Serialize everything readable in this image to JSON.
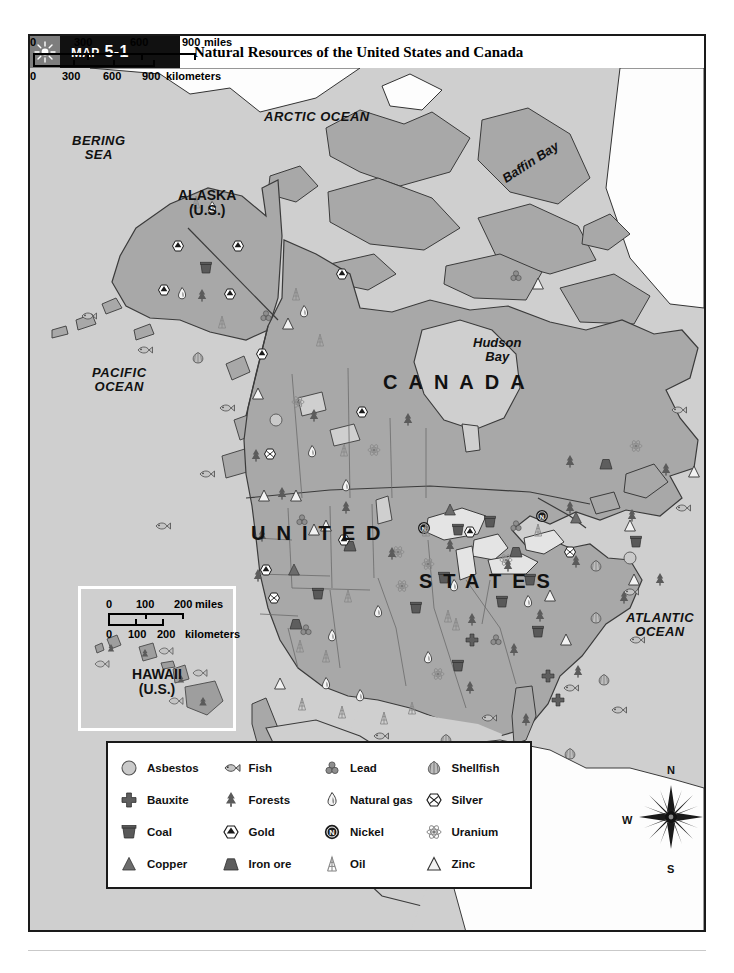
{
  "header": {
    "sun_icon": "sun-icon",
    "map_number": "Map 5-1",
    "title": "Natural Resources of the United States and Canada"
  },
  "map_labels": {
    "arctic_ocean": "ARCTIC OCEAN",
    "bering_sea_line1": "BERING",
    "bering_sea_line2": "SEA",
    "pacific_ocean_line1": "PACIFIC",
    "pacific_ocean_line2": "OCEAN",
    "atlantic_ocean_line1": "ATLANTIC",
    "atlantic_ocean_line2": "OCEAN",
    "baffin_bay": "Baffin Bay",
    "hudson_bay_line1": "Hudson",
    "hudson_bay_line2": "Bay",
    "canada": "CANADA",
    "united": "UNITED",
    "states": "STATES",
    "alaska_line1": "ALASKA",
    "alaska_line2": "(U.S.)",
    "hawaii_line1": "HAWAII",
    "hawaii_line2": "(U.S.)"
  },
  "scale_main": {
    "miles_ticks": [
      "0",
      "300",
      "600",
      "900"
    ],
    "miles_unit": "miles",
    "km_ticks": [
      "0",
      "300",
      "600",
      "900"
    ],
    "km_unit": "kilometers"
  },
  "scale_inset": {
    "miles_ticks": [
      "0",
      "100",
      "200"
    ],
    "miles_unit": "miles",
    "km_ticks": [
      "0",
      "100",
      "200"
    ],
    "km_unit": "kilometers"
  },
  "compass": {
    "north": "N",
    "south": "S",
    "east": "E",
    "west": "W"
  },
  "legend": {
    "items": [
      {
        "icon": "asbestos-circle-icon",
        "label": "Asbestos"
      },
      {
        "icon": "fish-icon",
        "label": "Fish"
      },
      {
        "icon": "lead-three-circles-icon",
        "label": "Lead"
      },
      {
        "icon": "shellfish-scallop-icon",
        "label": "Shellfish"
      },
      {
        "icon": "bauxite-cross-icon",
        "label": "Bauxite"
      },
      {
        "icon": "forests-tree-icon",
        "label": "Forests"
      },
      {
        "icon": "natural-gas-flame-icon",
        "label": "Natural gas"
      },
      {
        "icon": "silver-hexagon-icon",
        "label": "Silver"
      },
      {
        "icon": "coal-bucket-icon",
        "label": "Coal"
      },
      {
        "icon": "gold-hexagon-icon",
        "label": "Gold"
      },
      {
        "icon": "nickel-n-circle-icon",
        "label": "Nickel"
      },
      {
        "icon": "uranium-atom-icon",
        "label": "Uranium"
      },
      {
        "icon": "copper-triangle-icon",
        "label": "Copper"
      },
      {
        "icon": "iron-ore-trapezoid-icon",
        "label": "Iron ore"
      },
      {
        "icon": "oil-derrick-icon",
        "label": "Oil"
      },
      {
        "icon": "zinc-open-triangle-icon",
        "label": "Zinc"
      }
    ]
  },
  "colors": {
    "ocean": "#cfcfcf",
    "land_canada": "#a8a8a8",
    "land_us": "#a8a8a8",
    "lake": "#e4e4e4",
    "greenland_white": "#fdfdfd",
    "frame": "#1a1a1a",
    "title_bar": "#111111",
    "badge_icon_bg": "#7d7d7d"
  },
  "chart_data": {
    "type": "map",
    "title": "Natural Resources of the United States and Canada",
    "regions": [
      "Alaska (U.S.)",
      "Canada",
      "United States",
      "Hawaii (U.S.)"
    ],
    "water_bodies": [
      "Arctic Ocean",
      "Bering Sea",
      "Pacific Ocean",
      "Atlantic Ocean",
      "Baffin Bay",
      "Hudson Bay"
    ],
    "resource_symbols": [
      "Asbestos",
      "Bauxite",
      "Coal",
      "Copper",
      "Fish",
      "Forests",
      "Gold",
      "Iron ore",
      "Lead",
      "Natural gas",
      "Nickel",
      "Oil",
      "Shellfish",
      "Silver",
      "Uranium",
      "Zinc"
    ]
  }
}
